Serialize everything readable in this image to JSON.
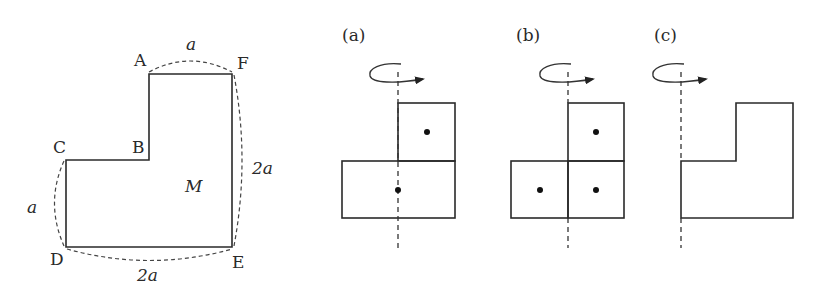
{
  "main_figure": {
    "vertices": {
      "A": "A",
      "B": "B",
      "C": "C",
      "D": "D",
      "E": "E",
      "F": "F"
    },
    "region_label": "M",
    "dimensions": {
      "AF": "a",
      "CD": "a",
      "FE": "2a",
      "DE": "2a"
    }
  },
  "panels": [
    {
      "label": "(a)",
      "description": "L-shape as two rectangles with centroid dots, axis through left edge of top square",
      "dots": 2
    },
    {
      "label": "(b)",
      "description": "L-shape as three unit squares with centroid dots",
      "dots": 3
    },
    {
      "label": "(c)",
      "description": "L-shape rotated about its left edge",
      "dots": 0
    }
  ],
  "colors": {
    "stroke": "#2a2a2a",
    "background": "#ffffff"
  }
}
